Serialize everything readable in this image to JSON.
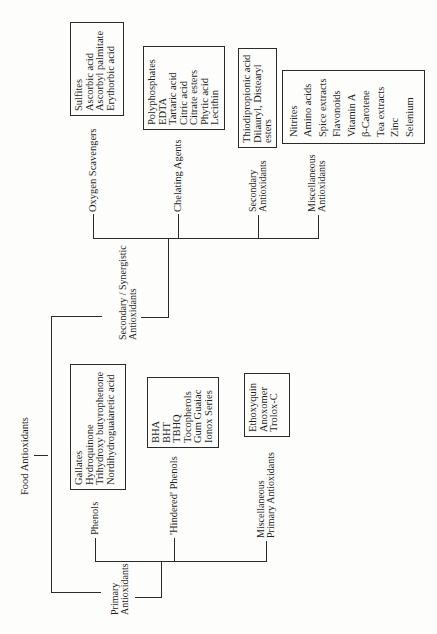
{
  "diagram": {
    "root": "Food Antioxidants",
    "branches": {
      "primary": {
        "label_line1": "Primary",
        "label_line2": "Antioxidants",
        "children": {
          "phenols": {
            "label": "Phenols",
            "items": [
              "Gallates",
              "Hydroquinone",
              "Trihydroxy butyrophenone",
              "Nordihydroguaiaretic acid"
            ]
          },
          "hindered_phenols": {
            "label": "'Hindered' Phenols",
            "items": [
              "BHA",
              "BHT",
              "TBHQ",
              "Tocopherols",
              "Gum Guaiac",
              "Ionox Series"
            ]
          },
          "misc_primary": {
            "label_line1": "Miscellaneous",
            "label_line2": "Primary Antioxidants",
            "items": [
              "Ethoxyquin",
              "Anoxomer",
              "Trolox-C"
            ]
          }
        }
      },
      "secondary": {
        "label_line1": "Secondary / Synergistic",
        "label_line2": "Antioxidants",
        "children": {
          "oxygen_scavengers": {
            "label": "Oxygen Scavengers",
            "items": [
              "Sulfites",
              "Ascorbic acid",
              "Ascorbyl palmitate",
              "Erythorbic acid"
            ]
          },
          "chelating_agents": {
            "label": "Chelating Agents",
            "items": [
              "Polyphosphates",
              "EDTA",
              "Tartaric acid",
              "Citric acid",
              "Citrate esters",
              "Phytic acid",
              "Lecithin"
            ]
          },
          "secondary_antioxidants": {
            "label_line1": "Secondary",
            "label_line2": "Antioxidants",
            "items": [
              "Thiodipropionic acid",
              "Dilauryl, Distearyl",
              "esters"
            ]
          },
          "misc_antioxidants": {
            "label_line1": "Miscellaneous",
            "label_line2": "Antioxidants",
            "items": [
              "Nitrites",
              "Amino acids",
              "Spice extracts",
              "Flavonoids",
              "Vitamin A",
              "β-Carotene",
              "Tea extracts",
              "Zinc",
              "Selenium"
            ]
          }
        }
      }
    }
  }
}
